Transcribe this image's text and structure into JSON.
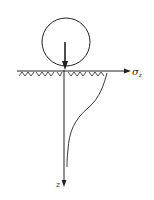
{
  "diagram": {
    "labels": {
      "horizontal_axis": "σ",
      "horizontal_axis_sub": "z",
      "vertical_axis": "z"
    },
    "colors": {
      "stroke": "#222222",
      "background": "#ffffff"
    }
  }
}
